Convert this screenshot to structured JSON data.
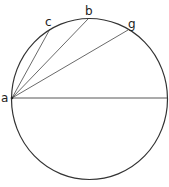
{
  "diagram": {
    "type": "circle-chords",
    "circle": {
      "cx": 89.5,
      "cy": 99,
      "rx": 78,
      "ry": 80.5
    },
    "points": [
      {
        "label": "a",
        "x": 12,
        "y": 98
      },
      {
        "label": "c",
        "x": 50,
        "y": 29
      },
      {
        "label": "b",
        "x": 88,
        "y": 19
      },
      {
        "label": "g",
        "x": 128,
        "y": 30
      }
    ],
    "segments": [
      [
        "a",
        "c"
      ],
      [
        "a",
        "b"
      ],
      [
        "a",
        "g"
      ],
      [
        "a",
        "diameter-end"
      ]
    ],
    "stroke_color": "#333333"
  }
}
